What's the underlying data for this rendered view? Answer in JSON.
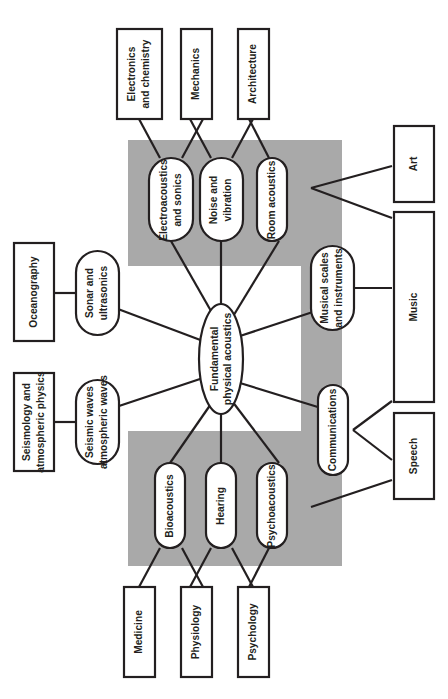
{
  "diagram": {
    "orientation_degrees": 90,
    "colors": {
      "band": "#a9a9a9",
      "stroke": "#231f20",
      "node_fill": "#ffffff",
      "background": "#ffffff"
    },
    "center": {
      "id": "center",
      "label_line1": "Fundamental",
      "label_line2": "physical acoustics",
      "shape": "ellipse"
    },
    "branches": [
      {
        "id": "electroacoustics",
        "label_line1": "Electroacoustics",
        "label_line2": "and sonics",
        "shape": "pill"
      },
      {
        "id": "noise-vibration",
        "label_line1": "Noise and",
        "label_line2": "vibration",
        "shape": "pill"
      },
      {
        "id": "room-acoustics",
        "label_line1": "Room acoustics",
        "label_line2": "",
        "shape": "pill"
      },
      {
        "id": "musical-scales",
        "label_line1": "Musical scales",
        "label_line2": "and instruments",
        "shape": "pill"
      },
      {
        "id": "communications",
        "label_line1": "Communications",
        "label_line2": "",
        "shape": "pill"
      },
      {
        "id": "psychoacoustics",
        "label_line1": "Psychoacoustics",
        "label_line2": "",
        "shape": "pill"
      },
      {
        "id": "hearing",
        "label_line1": "Hearing",
        "label_line2": "",
        "shape": "pill"
      },
      {
        "id": "bioacoustics",
        "label_line1": "Bioacoustics",
        "label_line2": "",
        "shape": "pill"
      },
      {
        "id": "seismic-waves",
        "label_line1": "Seismic waves",
        "label_line2": "atmospheric waves",
        "shape": "pill"
      },
      {
        "id": "sonar-ultrasonics",
        "label_line1": "Sonar and",
        "label_line2": "ultrasonics",
        "shape": "pill"
      }
    ],
    "disciplines": [
      {
        "id": "electronics-chemistry",
        "label_line1": "Electronics",
        "label_line2": "and chemistry",
        "shape": "box"
      },
      {
        "id": "mechanics",
        "label_line1": "Mechanics",
        "label_line2": "",
        "shape": "box"
      },
      {
        "id": "architecture",
        "label_line1": "Architecture",
        "label_line2": "",
        "shape": "box"
      },
      {
        "id": "art",
        "label_line1": "Art",
        "label_line2": "",
        "shape": "box"
      },
      {
        "id": "music",
        "label_line1": "Music",
        "label_line2": "",
        "shape": "box"
      },
      {
        "id": "speech",
        "label_line1": "Speech",
        "label_line2": "",
        "shape": "box"
      },
      {
        "id": "psychology",
        "label_line1": "Psychology",
        "label_line2": "",
        "shape": "box"
      },
      {
        "id": "physiology",
        "label_line1": "Physiology",
        "label_line2": "",
        "shape": "box"
      },
      {
        "id": "medicine",
        "label_line1": "Medicine",
        "label_line2": "",
        "shape": "box"
      },
      {
        "id": "seismology-atmospheric",
        "label_line1": "Seismology and",
        "label_line2": "atmospheric physics",
        "shape": "box"
      },
      {
        "id": "oceanography",
        "label_line1": "Oceanography",
        "label_line2": "",
        "shape": "box"
      }
    ],
    "connections": [
      {
        "from": "center",
        "to": "electroacoustics"
      },
      {
        "from": "center",
        "to": "noise-vibration"
      },
      {
        "from": "center",
        "to": "room-acoustics"
      },
      {
        "from": "center",
        "to": "musical-scales"
      },
      {
        "from": "center",
        "to": "communications"
      },
      {
        "from": "center",
        "to": "psychoacoustics"
      },
      {
        "from": "center",
        "to": "hearing"
      },
      {
        "from": "center",
        "to": "bioacoustics"
      },
      {
        "from": "center",
        "to": "seismic-waves"
      },
      {
        "from": "center",
        "to": "sonar-ultrasonics"
      },
      {
        "from": "electroacoustics",
        "to": "electronics-chemistry"
      },
      {
        "from": "electroacoustics",
        "to": "mechanics"
      },
      {
        "from": "noise-vibration",
        "to": "mechanics"
      },
      {
        "from": "noise-vibration",
        "to": "architecture"
      },
      {
        "from": "room-acoustics",
        "to": "architecture"
      },
      {
        "from": "room-acoustics",
        "to": "art"
      },
      {
        "from": "room-acoustics",
        "to": "music"
      },
      {
        "from": "musical-scales",
        "to": "music"
      },
      {
        "from": "communications",
        "to": "music"
      },
      {
        "from": "communications",
        "to": "speech"
      },
      {
        "from": "psychoacoustics",
        "to": "speech"
      },
      {
        "from": "psychoacoustics",
        "to": "psychology"
      },
      {
        "from": "hearing",
        "to": "psychology"
      },
      {
        "from": "hearing",
        "to": "physiology"
      },
      {
        "from": "bioacoustics",
        "to": "physiology"
      },
      {
        "from": "bioacoustics",
        "to": "medicine"
      },
      {
        "from": "seismic-waves",
        "to": "seismology-atmospheric"
      },
      {
        "from": "sonar-ultrasonics",
        "to": "oceanography"
      }
    ]
  }
}
